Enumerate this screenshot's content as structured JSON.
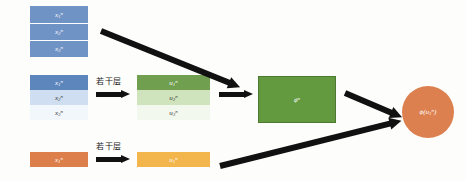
{
  "figure": {
    "type": "neural-network-architecture-diagram",
    "background_color": "#fdfdfc"
  },
  "colors": {
    "input_blue": "#6f93c4",
    "input_blue_dark": "#5d86bd",
    "input_blue_pale": "#cfdff1",
    "input_blue_faint": "#f2f7fc",
    "input_orange": "#dd7f4b",
    "hidden_green": "#6f9f4f",
    "hidden_green_pale": "#cfe3bd",
    "hidden_green_faint": "#f3f8ee",
    "hidden_yellow": "#f3b64c",
    "feature_green": "#63993f",
    "output_orange": "#dd8050",
    "arrow_black": "#111111"
  },
  "input_groups": [
    {
      "id": "x-top",
      "style": "solid-blue",
      "bands": [
        {
          "label_base": "x",
          "sub": "1",
          "sup": "n",
          "tone": "dark"
        },
        {
          "label_base": "x",
          "sub": "2",
          "sup": "n",
          "tone": "dark"
        },
        {
          "label_base": "x",
          "sub": "3",
          "sup": "n",
          "tone": "dark"
        }
      ]
    },
    {
      "id": "x-mid",
      "style": "fading-blue",
      "bands": [
        {
          "label_base": "x",
          "sub": "1",
          "sup": "n",
          "tone": "dark"
        },
        {
          "label_base": "x",
          "sub": "2",
          "sup": "n",
          "tone": "mid"
        },
        {
          "label_base": "x",
          "sub": "3",
          "sup": "n",
          "tone": "pale"
        }
      ]
    },
    {
      "id": "x-bot",
      "style": "solid-orange",
      "bands": [
        {
          "label_base": "x",
          "sub": "1",
          "sup": "n",
          "tone": "dark"
        }
      ]
    }
  ],
  "hidden_groups": [
    {
      "id": "u-mid",
      "style": "fading-green",
      "bands": [
        {
          "label_base": "u",
          "sub": "1",
          "sup": "n",
          "tone": "dark"
        },
        {
          "label_base": "u",
          "sub": "2",
          "sup": "n",
          "tone": "mid"
        },
        {
          "label_base": "u",
          "sub": "3",
          "sup": "n",
          "tone": "pale"
        }
      ]
    },
    {
      "id": "u-bot",
      "style": "solid-yellow",
      "bands": [
        {
          "label_base": "u",
          "sub": "1",
          "sup": "n",
          "tone": "dark"
        }
      ]
    }
  ],
  "feature_block": {
    "label_base": "ϕ",
    "sup": "n"
  },
  "output_node": {
    "label": "ϕ(u",
    "sub": "1",
    "sup": "n",
    "label_tail": ")"
  },
  "captions": {
    "middle": "若干层",
    "bottom": "若干层"
  },
  "arrows": {
    "mid_layers": "arrow-right",
    "bot_layers": "arrow-right",
    "mid_to_feature": "arrow-right",
    "top_to_feature": "arrow-diagonal-down-right",
    "feature_to_output": "arrow-diagonal-down-right",
    "bot_to_output": "arrow-diagonal-up-right"
  }
}
